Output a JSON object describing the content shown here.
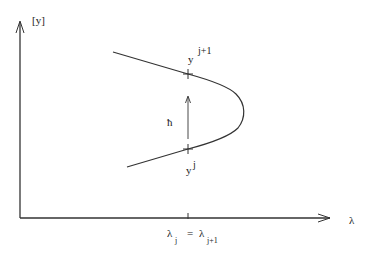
{
  "diagram": {
    "y_axis_label": "[y]",
    "x_axis_label": "λ",
    "upper_point": {
      "base": "y",
      "sup": "j+1"
    },
    "lower_point": {
      "base": "y",
      "sup": "j"
    },
    "step_label": "ħ",
    "x_tick_label": {
      "left": "λ",
      "left_sub": "j",
      "eq": "=",
      "right": "λ",
      "right_sub": "j+1"
    },
    "colors": {
      "stroke": "#333333",
      "background": "#ffffff"
    }
  }
}
